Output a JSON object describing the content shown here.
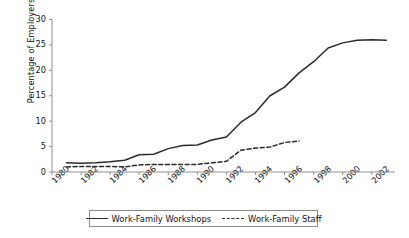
{
  "chart_data": {
    "type": "line",
    "title": "",
    "xlabel": "",
    "ylabel": "Percentage of Employers",
    "xlim": [
      1980,
      2003.6
    ],
    "ylim": [
      0,
      30
    ],
    "grid": false,
    "legend_position": "bottom",
    "y_ticks": [
      0,
      5,
      10,
      15,
      20,
      25,
      30
    ],
    "y_tick_labels": [
      "0",
      "5",
      "10",
      "15",
      "20",
      "25",
      "30"
    ],
    "x_ticks": [
      1980,
      1982,
      1984,
      1986,
      1988,
      1990,
      1992,
      1994,
      1996,
      1998,
      2000,
      2002
    ],
    "x_tick_labels": [
      "1980",
      "1982",
      "1984",
      "1986",
      "1988",
      "1990",
      "1992",
      "1994",
      "1996",
      "1998",
      "2000",
      "2002"
    ],
    "series": [
      {
        "name": "Work-Family Workshops",
        "style": "solid",
        "color": "#2b2b2b",
        "x": [
          1981,
          1982,
          1983,
          1984,
          1985,
          1986,
          1987,
          1988,
          1989,
          1990,
          1991,
          1992,
          1993,
          1994,
          1995,
          1996,
          1997,
          1998,
          1999,
          2000,
          2001,
          2002,
          2003
        ],
        "values": [
          1.8,
          1.7,
          1.8,
          2.0,
          2.3,
          3.4,
          3.5,
          4.6,
          5.2,
          5.3,
          6.3,
          6.9,
          9.8,
          11.7,
          15.0,
          16.7,
          19.5,
          21.7,
          24.4,
          25.4,
          25.9,
          26.0,
          25.9
        ]
      },
      {
        "name": "Work-Family Staff",
        "style": "dashed",
        "color": "#2b2b2b",
        "x": [
          1981,
          1982,
          1983,
          1984,
          1985,
          1986,
          1987,
          1988,
          1989,
          1990,
          1991,
          1992,
          1993,
          1994,
          1995,
          1996,
          1997
        ],
        "values": [
          1.0,
          1.1,
          1.1,
          1.1,
          1.0,
          1.4,
          1.5,
          1.5,
          1.5,
          1.5,
          1.8,
          2.1,
          4.3,
          4.7,
          4.9,
          5.8,
          6.1
        ]
      }
    ]
  },
  "legend": {
    "entries": [
      {
        "label": "Work-Family Workshops",
        "style": "solid"
      },
      {
        "label": "Work-Family Staff",
        "style": "dashed"
      }
    ]
  }
}
